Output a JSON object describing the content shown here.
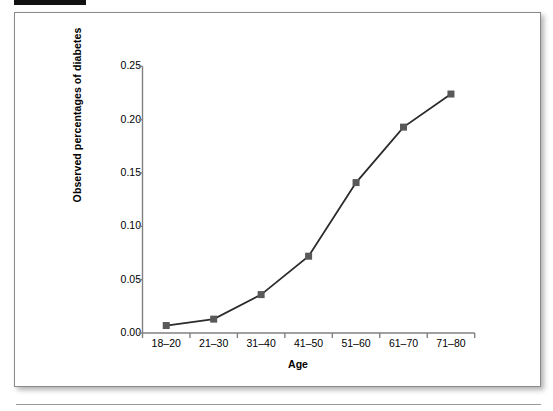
{
  "page": {
    "redaction_label": "",
    "figure_background": "#ffffff",
    "frame_border_color": "#8a8a8a"
  },
  "chart_data": {
    "type": "line",
    "title": "",
    "xlabel": "Age",
    "ylabel": "Observed percentages of diabetes",
    "categories": [
      "18–20",
      "21–30",
      "31–40",
      "41–50",
      "51–60",
      "61–70",
      "71–80"
    ],
    "values": [
      0.007,
      0.013,
      0.036,
      0.072,
      0.141,
      0.193,
      0.224
    ],
    "series": [
      {
        "name": "Observed percentages of diabetes",
        "values": [
          0.007,
          0.013,
          0.036,
          0.072,
          0.141,
          0.193,
          0.224
        ]
      }
    ],
    "ylim": [
      0.0,
      0.25
    ],
    "ytick_labels": [
      "0.00",
      "0.05",
      "0.10",
      "0.15",
      "0.20",
      "0.25"
    ],
    "ytick_values": [
      0.0,
      0.05,
      0.1,
      0.15,
      0.2,
      0.25
    ],
    "grid": false,
    "legend": false,
    "legend_position": "none",
    "line_color": "#2b2b2b",
    "marker_color": "#595959",
    "marker_shape": "square",
    "axis_color": "#808080"
  }
}
